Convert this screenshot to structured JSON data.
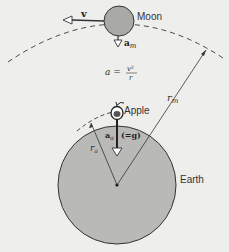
{
  "labels": {
    "moon": "Moon",
    "earth": "Earth",
    "apple": "Apple",
    "velocity": "v",
    "moon_accel": "a",
    "moon_accel_sub": "m",
    "apple_accel": "a",
    "apple_accel_sub": "a",
    "apple_accel_eq": "(=g)",
    "formula_lhs": "a =",
    "formula_num": "v²",
    "formula_den": "r",
    "r_moon": "r",
    "r_moon_sub": "m",
    "r_apple": "r",
    "r_apple_sub": "a"
  },
  "colors": {
    "background": "#eeeeec",
    "earth_fill": "#b9b9b7",
    "moon_fill": "#a9a9a7",
    "stroke": "#333333"
  }
}
